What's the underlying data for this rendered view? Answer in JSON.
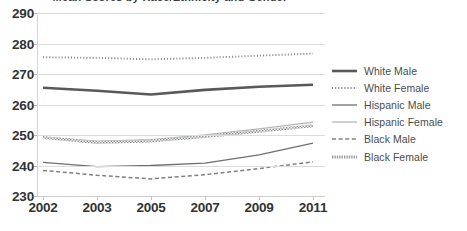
{
  "chart_title": "Mean Scores by Race/Ethnicity and Gender",
  "axes": {
    "y_ticks": [
      "290",
      "280",
      "270",
      "260",
      "250",
      "240",
      "230"
    ],
    "x_ticks": [
      "2002",
      "2003",
      "2005",
      "2007",
      "2009",
      "2011"
    ],
    "ylabel": "",
    "xlabel": ""
  },
  "legend": {
    "position": "right",
    "items": [
      {
        "label": "White Male",
        "style": "thick-solid",
        "color": "#59595b"
      },
      {
        "label": "White Female",
        "style": "dotted",
        "color": "#8a8a8c"
      },
      {
        "label": "Hispanic Male",
        "style": "solid",
        "color": "#6d6f71"
      },
      {
        "label": "Hispanic Female",
        "style": "thin-light",
        "color": "#b4b6b8"
      },
      {
        "label": "Black Male",
        "style": "dashed",
        "color": "#7e8082"
      },
      {
        "label": "Black Female",
        "style": "hatched",
        "color": "#9a9c9e"
      }
    ]
  },
  "chart_data": {
    "type": "line",
    "title": "Mean Scores by Race/Ethnicity and Gender",
    "xlabel": "",
    "ylabel": "",
    "x": [
      "2002",
      "2003",
      "2005",
      "2007",
      "2009",
      "2011"
    ],
    "categories": [
      "2002",
      "2003",
      "2005",
      "2007",
      "2009",
      "2011"
    ],
    "ylim": [
      230,
      290
    ],
    "ytick_step": 10,
    "grid": true,
    "legend_position": "right",
    "series": [
      {
        "name": "White Male",
        "values": [
          265.5,
          264.5,
          263.3,
          264.8,
          265.8,
          266.5
        ],
        "color": "#59595b",
        "style": "thick-solid"
      },
      {
        "name": "White Female",
        "values": [
          275.5,
          275.3,
          274.8,
          275.3,
          276.0,
          276.7
        ],
        "color": "#8a8a8c",
        "style": "dotted"
      },
      {
        "name": "Hispanic Male",
        "values": [
          241.0,
          239.6,
          240.0,
          240.8,
          243.5,
          247.3
        ],
        "color": "#6d6f71",
        "style": "solid"
      },
      {
        "name": "Hispanic Female",
        "values": [
          249.3,
          248.0,
          248.5,
          250.0,
          252.0,
          254.2
        ],
        "color": "#b4b6b8",
        "style": "thin-light"
      },
      {
        "name": "Black Male",
        "values": [
          238.4,
          236.8,
          235.6,
          237.0,
          239.0,
          241.2
        ],
        "color": "#7e8082",
        "style": "dashed"
      },
      {
        "name": "Black Female",
        "values": [
          249.2,
          247.5,
          248.0,
          249.5,
          251.2,
          253.0
        ],
        "color": "#9a9c9e",
        "style": "hatched"
      }
    ]
  },
  "colors": {
    "background": "#ffffff",
    "gridline": "#dcdcdc",
    "tick_text": "#313436",
    "legend_text": "#4a4d4f"
  }
}
